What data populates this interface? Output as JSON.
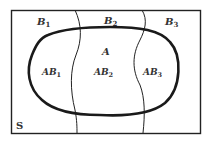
{
  "diagram": {
    "sample_space_label": "S",
    "event_label": "A",
    "partitions": [
      {
        "label": "B",
        "sub": "1"
      },
      {
        "label": "B",
        "sub": "2"
      },
      {
        "label": "B",
        "sub": "3"
      }
    ],
    "intersections": [
      {
        "label": "AB",
        "sub": "1"
      },
      {
        "label": "AB",
        "sub": "2"
      },
      {
        "label": "AB",
        "sub": "3"
      }
    ],
    "colors": {
      "line": "#1a1a1a",
      "background": "#ffffff"
    }
  }
}
